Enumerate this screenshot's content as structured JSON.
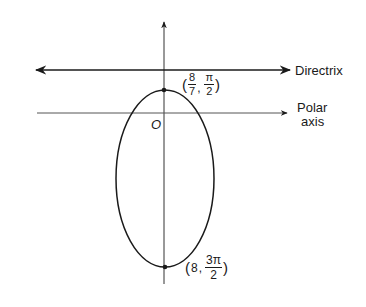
{
  "diagram": {
    "type": "polar conic (ellipse) with directrix",
    "colors": {
      "ink": "#1a1a1a",
      "background": "#ffffff"
    },
    "labels": {
      "directrix": "Directrix",
      "polar_axis_line1": "Polar",
      "polar_axis_line2": "axis",
      "origin": "O"
    },
    "points": [
      {
        "name": "top-vertex",
        "r_num": "8",
        "r_den": "7",
        "theta_num": "π",
        "theta_den": "2",
        "open": "(",
        "sep": ",",
        "close": ")"
      },
      {
        "name": "bottom-vertex",
        "r": "8",
        "theta_num": "3π",
        "theta_den": "2",
        "open": "(",
        "sep": ",",
        "close": ")"
      }
    ]
  }
}
